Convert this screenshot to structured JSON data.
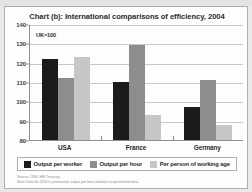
{
  "page": {
    "background_color": "#e9e9e9",
    "cut_off_header_text": ""
  },
  "figure": {
    "title": "Chart (b): International comparisons of efficiency, 2004",
    "annotation": "UK=100",
    "footnotes": [
      "Source: ONS, HM Treasury",
      "Note: Data for 2004 is provisional; output per hour worked is experimental data"
    ]
  },
  "chart_data": {
    "type": "bar",
    "title": "Chart (b): International comparisons of efficiency, 2004",
    "xlabel": "",
    "ylabel": "",
    "ylim": [
      80,
      140
    ],
    "yticks": [
      140,
      130,
      120,
      110,
      100,
      90,
      80
    ],
    "grid": true,
    "legend_position": "bottom",
    "annotations": [
      "UK=100"
    ],
    "categories": [
      "USA",
      "France",
      "Germany"
    ],
    "series": [
      {
        "name": "Output per worker",
        "color": "#1b1b1b",
        "values": [
          122,
          110,
          97
        ]
      },
      {
        "name": "Output per hour",
        "color": "#8d8d8d",
        "values": [
          112,
          129,
          111
        ]
      },
      {
        "name": "Per person of working age",
        "color": "#c6c6c6",
        "values": [
          123,
          93,
          88
        ]
      }
    ]
  }
}
